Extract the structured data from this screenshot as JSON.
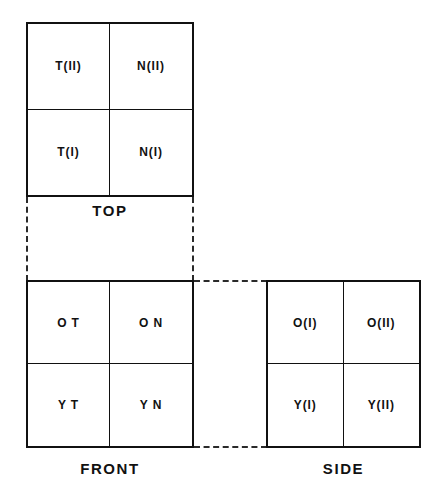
{
  "diagram": {
    "stroke_color": "#111111",
    "dash_color": "#2a2a2a",
    "background_color": "#ffffff",
    "views": [
      {
        "id": "top",
        "label": "TOP",
        "cells": [
          {
            "position": "upper-left",
            "text": "T(II)"
          },
          {
            "position": "upper-right",
            "text": "N(II)"
          },
          {
            "position": "lower-left",
            "text": "T(I)"
          },
          {
            "position": "lower-right",
            "text": "N(I)"
          }
        ]
      },
      {
        "id": "front",
        "label": "FRONT",
        "cells": [
          {
            "position": "upper-left",
            "text": "O T"
          },
          {
            "position": "upper-right",
            "text": "O N"
          },
          {
            "position": "lower-left",
            "text": "Y T"
          },
          {
            "position": "lower-right",
            "text": "Y N"
          }
        ]
      },
      {
        "id": "side",
        "label": "SIDE",
        "cells": [
          {
            "position": "upper-left",
            "text": "O(I)"
          },
          {
            "position": "upper-right",
            "text": "O(II)"
          },
          {
            "position": "lower-left",
            "text": "Y(I)"
          },
          {
            "position": "lower-right",
            "text": "Y(II)"
          }
        ]
      }
    ],
    "projection_lines": [
      {
        "id": "left-vertical",
        "orientation": "vertical",
        "style": "dashed"
      },
      {
        "id": "right-vertical",
        "orientation": "vertical",
        "style": "dashed"
      },
      {
        "id": "upper-horizontal",
        "orientation": "horizontal",
        "style": "dashed"
      },
      {
        "id": "lower-horizontal",
        "orientation": "horizontal",
        "style": "dashed"
      }
    ]
  }
}
